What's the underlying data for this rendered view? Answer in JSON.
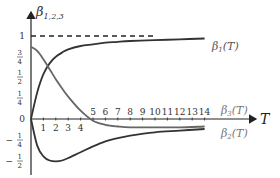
{
  "chart_data": {
    "type": "line",
    "title": "",
    "ylabel": "β_{1,2,3}",
    "xlabel": "T",
    "xlim": [
      0,
      15
    ],
    "ylim": [
      -0.5,
      1
    ],
    "grid": false,
    "legend_position": "inline-right",
    "x_ticks": [
      "1",
      "2",
      "3",
      "4",
      "5",
      "6",
      "7",
      "8",
      "9",
      "10",
      "11",
      "12",
      "13",
      "14"
    ],
    "y_ticks": [
      {
        "value": 1,
        "label": "1"
      },
      {
        "value": 0.75,
        "label": "3/4"
      },
      {
        "value": 0.5,
        "label": "1/2"
      },
      {
        "value": 0.25,
        "label": "1/4"
      },
      {
        "value": 0,
        "label": "0"
      },
      {
        "value": -0.25,
        "label": "−1/4"
      },
      {
        "value": -0.5,
        "label": "−1/2"
      }
    ],
    "reference_line": {
      "y": 1,
      "style": "dashed",
      "x_range": [
        0,
        10
      ]
    },
    "x": [
      0,
      0.5,
      1,
      1.5,
      2,
      2.5,
      3,
      4,
      5,
      6,
      7,
      8,
      10,
      12,
      14
    ],
    "series": [
      {
        "name": "β1(T)",
        "color": "#333333",
        "values": [
          0.0,
          0.32,
          0.54,
          0.67,
          0.75,
          0.8,
          0.84,
          0.88,
          0.9,
          0.92,
          0.93,
          0.94,
          0.95,
          0.96,
          0.97
        ]
      },
      {
        "name": "β2(T)",
        "color": "#333333",
        "values": [
          0.0,
          -0.32,
          -0.45,
          -0.5,
          -0.51,
          -0.5,
          -0.47,
          -0.4,
          -0.33,
          -0.27,
          -0.23,
          -0.2,
          -0.16,
          -0.14,
          -0.12
        ]
      },
      {
        "name": "β3(T)",
        "color": "#555555",
        "values": [
          0.87,
          0.82,
          0.72,
          0.6,
          0.48,
          0.37,
          0.27,
          0.1,
          -0.02,
          -0.07,
          -0.09,
          -0.1,
          -0.1,
          -0.1,
          -0.09
        ]
      }
    ]
  },
  "labels": {
    "y_axis": "β",
    "y_axis_sub": "1,2,3",
    "x_axis": "T",
    "beta1": "β",
    "beta1_sub": "1",
    "beta1_arg": "(T)",
    "beta2": "β",
    "beta2_sub": "2",
    "beta2_arg": "(T)",
    "beta3": "β",
    "beta3_sub": "3",
    "beta3_arg": "(T)"
  }
}
